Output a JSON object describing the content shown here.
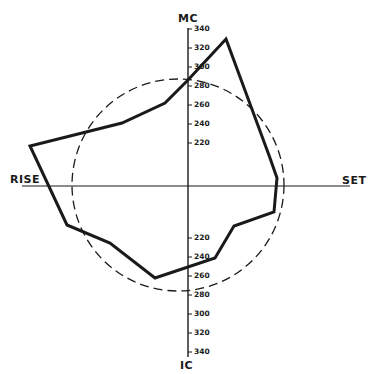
{
  "diagram": {
    "type": "horoscope-style polar diagram",
    "axis_labels": {
      "top": "MC",
      "bottom": "IC",
      "left": "RISE",
      "right": "SET"
    },
    "upper_ticks": [
      "340",
      "320",
      "300",
      "280",
      "260",
      "240",
      "220"
    ],
    "lower_ticks": [
      "220",
      "240",
      "260",
      "280",
      "300",
      "320",
      "340"
    ],
    "circle": {
      "style": "dashed",
      "center": [
        178,
        185
      ],
      "radius": 106
    },
    "polygon": {
      "style": "solid-thick",
      "points": [
        [
          226,
          39
        ],
        [
          270,
          158
        ],
        [
          277,
          178
        ],
        [
          274,
          212
        ],
        [
          234,
          226
        ],
        [
          215,
          258
        ],
        [
          155,
          278
        ],
        [
          110,
          243
        ],
        [
          67,
          225
        ],
        [
          30,
          146
        ],
        [
          122,
          123
        ],
        [
          165,
          103
        ],
        [
          188,
          80
        ]
      ]
    },
    "colors": {
      "ink": "#1a1a1a",
      "background": "#ffffff"
    }
  }
}
